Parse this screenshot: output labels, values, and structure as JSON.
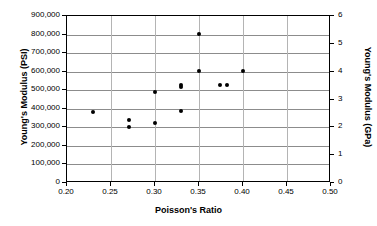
{
  "chart_data": {
    "type": "scatter",
    "title": "",
    "xlabel": "Poisson's Ratio",
    "ylabel": "Young's Modulus (PSI)",
    "ylabel_secondary": "Young's Modulus (GPa)",
    "xlim": [
      0.2,
      0.5
    ],
    "ylim": [
      0,
      900000
    ],
    "ylim_secondary": [
      0,
      6
    ],
    "xticks": [
      0.2,
      0.25,
      0.3,
      0.35,
      0.4,
      0.45,
      0.5
    ],
    "xtick_labels": [
      "0.20",
      "0.25",
      "0.30",
      "0.35",
      "0.40",
      "0.45",
      "0.50"
    ],
    "yticks": [
      0,
      100000,
      200000,
      300000,
      400000,
      500000,
      600000,
      700000,
      800000,
      900000
    ],
    "ytick_labels": [
      "0",
      "100,000",
      "200,000",
      "300,000",
      "400,000",
      "500,000",
      "600,000",
      "700,000",
      "800,000",
      "900,000"
    ],
    "yticks_secondary": [
      0,
      1,
      2,
      3,
      4,
      5,
      6
    ],
    "ytick_labels_secondary": [
      "0",
      "1",
      "2",
      "3",
      "4",
      "5",
      "6"
    ],
    "grid": "horizontal-and-vertical",
    "legend": "none",
    "marker_color": "#000000",
    "grid_color": "#8c8c8c",
    "axis_color": "#000000",
    "points": [
      {
        "x": 0.23,
        "y": 380000
      },
      {
        "x": 0.27,
        "y": 340000
      },
      {
        "x": 0.27,
        "y": 300000
      },
      {
        "x": 0.3,
        "y": 490000
      },
      {
        "x": 0.3,
        "y": 325000
      },
      {
        "x": 0.33,
        "y": 530000
      },
      {
        "x": 0.33,
        "y": 515000
      },
      {
        "x": 0.33,
        "y": 390000
      },
      {
        "x": 0.35,
        "y": 805000
      },
      {
        "x": 0.35,
        "y": 605000
      },
      {
        "x": 0.374,
        "y": 528000
      },
      {
        "x": 0.382,
        "y": 528000
      },
      {
        "x": 0.4,
        "y": 605000
      }
    ]
  }
}
